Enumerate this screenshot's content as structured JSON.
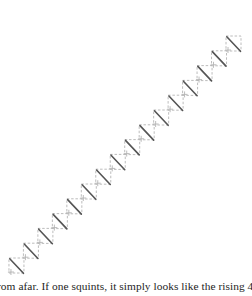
{
  "figure": {
    "unit_count": 16,
    "unit_size": 15,
    "start": {
      "x": 226,
      "y": 36
    },
    "step": {
      "dx": -14.47,
      "dy": 14.8
    },
    "colors": {
      "diagonal": "#555555",
      "dashed_grid": "#b4b4b4",
      "background": "#ffffff"
    }
  },
  "text": {
    "caption_line": "rom afar. If one squints, it simply looks like the rising 45-d"
  }
}
